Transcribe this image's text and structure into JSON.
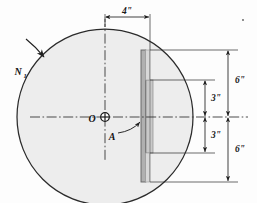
{
  "figure": {
    "kind": "engineering-diagram",
    "background_color": "#fdfdfd"
  },
  "disc": {
    "name": "rotating-disc",
    "center_label": "O",
    "fill_color": "#ededed",
    "outline_color": "#2b2b2b",
    "center_x": 105,
    "center_y": 117,
    "radius": 88
  },
  "rotation": {
    "label": "N",
    "subscript": "1",
    "full_label": "N1",
    "meaning": "rotational-speed-arrow"
  },
  "plate": {
    "name": "slotted-plate",
    "callout_label": "A",
    "edge_color": "#6e6e6e",
    "web_fill": "#b8b8b8",
    "flange_fill": "#cfcfcf",
    "top_y": 50,
    "bottom_y": 182
  },
  "centerlines": {
    "style": "dash-dot",
    "color": "#2b2b2b",
    "horizontal": true,
    "vertical": true
  },
  "dimensions": [
    {
      "id": "width-4in",
      "label": "4\"",
      "orientation": "horizontal",
      "position": "top",
      "from": "vertical-centerline",
      "to": "plate-right-face"
    },
    {
      "id": "upper-6in",
      "label": "6\"",
      "orientation": "vertical",
      "position": "upper-outer",
      "from": "plate-top",
      "to": "horizontal-centerline"
    },
    {
      "id": "upper-3in",
      "label": "3\"",
      "orientation": "vertical",
      "position": "upper-inner",
      "from": "slot-top",
      "to": "horizontal-centerline"
    },
    {
      "id": "lower-3in",
      "label": "3\"",
      "orientation": "vertical",
      "position": "lower-inner",
      "from": "horizontal-centerline",
      "to": "slot-bottom"
    },
    {
      "id": "lower-6in",
      "label": "6\"",
      "orientation": "vertical",
      "position": "lower-outer",
      "from": "horizontal-centerline",
      "to": "plate-bottom"
    }
  ],
  "annotations": {
    "corner_dot": "."
  }
}
